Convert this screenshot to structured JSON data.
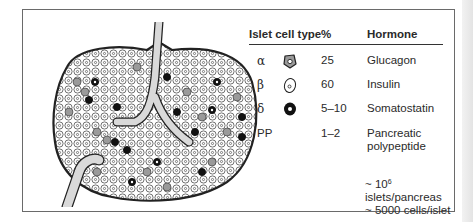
{
  "figure": {
    "illustration_label": "Islet cross-section with capillaries and cell types",
    "legend": {
      "headers": {
        "cell_type": "Islet cell type",
        "percent": "%",
        "hormone": "Hormone"
      },
      "rows": [
        {
          "symbol": "α",
          "icon": "alpha-cell-icon",
          "percent": "25",
          "hormone": "Glucagon"
        },
        {
          "symbol": "β",
          "icon": "beta-cell-icon",
          "percent": "60",
          "hormone": "Insulin"
        },
        {
          "symbol": "δ",
          "icon": "delta-cell-icon",
          "percent": "5–10",
          "hormone": "Somatostatin"
        },
        {
          "symbol": "PP",
          "icon": "",
          "percent": "1–2",
          "hormone_line1": "Pancreatic",
          "hormone_line2": "polypeptide"
        }
      ]
    },
    "notes": {
      "line1_prefix": "~ 10",
      "line1_exp": "6",
      "line1_suffix": " islets/pancreas",
      "line2": "~ 5000 cells/islet"
    },
    "colors": {
      "ink": "#2a2a2a",
      "alpha_fill": "#9a9a9a",
      "beta_fill": "#ffffff",
      "delta_fill": "#111111",
      "vessel": "#d9d9d9"
    }
  }
}
